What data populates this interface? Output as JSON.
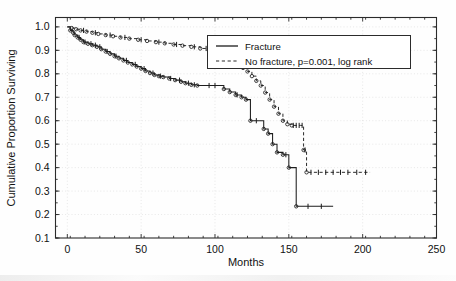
{
  "chart_data": {
    "type": "line",
    "title": "",
    "xlabel": "Months",
    "ylabel": "Cumulative Proportion Surviving",
    "xlim": [
      -8,
      250
    ],
    "ylim": [
      0.1,
      1.04
    ],
    "xticks": [
      0,
      50,
      100,
      150,
      200,
      250
    ],
    "xtick_labels": [
      "0",
      "50",
      "100",
      "150",
      "200",
      "250"
    ],
    "yticks": [
      0.1,
      0.2,
      0.3,
      0.4,
      0.5,
      0.6,
      0.7,
      0.8,
      0.9,
      1.0
    ],
    "ytick_labels": [
      "0.1",
      "0.2",
      "0.3",
      "0.4",
      "0.5",
      "0.6",
      "0.7",
      "0.8",
      "0.9",
      "1.0"
    ],
    "grid": true,
    "legend_position": "upper-right",
    "annotation": "p=0.001, log rank",
    "series": [
      {
        "name": "Fracture",
        "style": "solid",
        "points": [
          [
            0,
            1.0
          ],
          [
            2,
            0.985
          ],
          [
            4,
            0.975
          ],
          [
            5,
            0.965
          ],
          [
            7,
            0.955
          ],
          [
            9,
            0.945
          ],
          [
            11,
            0.935
          ],
          [
            14,
            0.928
          ],
          [
            17,
            0.922
          ],
          [
            20,
            0.915
          ],
          [
            23,
            0.905
          ],
          [
            26,
            0.895
          ],
          [
            29,
            0.885
          ],
          [
            32,
            0.875
          ],
          [
            35,
            0.866
          ],
          [
            38,
            0.857
          ],
          [
            41,
            0.848
          ],
          [
            44,
            0.84
          ],
          [
            47,
            0.831
          ],
          [
            50,
            0.822
          ],
          [
            53,
            0.812
          ],
          [
            56,
            0.803
          ],
          [
            59,
            0.795
          ],
          [
            62,
            0.79
          ],
          [
            65,
            0.786
          ],
          [
            69,
            0.78
          ],
          [
            73,
            0.773
          ],
          [
            77,
            0.766
          ],
          [
            80,
            0.76
          ],
          [
            84,
            0.753
          ],
          [
            88,
            0.75
          ],
          [
            104,
            0.75
          ],
          [
            106,
            0.735
          ],
          [
            110,
            0.722
          ],
          [
            114,
            0.71
          ],
          [
            118,
            0.7
          ],
          [
            121,
            0.69
          ],
          [
            124,
            0.6
          ],
          [
            131,
            0.6
          ],
          [
            133,
            0.565
          ],
          [
            136,
            0.545
          ],
          [
            139,
            0.5
          ],
          [
            142,
            0.465
          ],
          [
            146,
            0.455
          ],
          [
            150,
            0.4
          ],
          [
            152,
            0.4
          ],
          [
            155,
            0.235
          ],
          [
            180,
            0.235
          ]
        ],
        "censored_months": [
          8,
          12,
          16,
          19,
          22,
          27,
          33,
          40,
          46,
          52,
          58,
          63,
          70,
          76,
          82,
          86,
          96,
          100,
          115,
          128,
          148,
          163,
          172
        ],
        "final_survival": 0.235
      },
      {
        "name": "No fracture",
        "style": "dashed",
        "points": [
          [
            0,
            1.0
          ],
          [
            3,
            0.995
          ],
          [
            6,
            0.99
          ],
          [
            9,
            0.985
          ],
          [
            13,
            0.98
          ],
          [
            17,
            0.975
          ],
          [
            21,
            0.97
          ],
          [
            26,
            0.965
          ],
          [
            31,
            0.96
          ],
          [
            36,
            0.955
          ],
          [
            42,
            0.95
          ],
          [
            48,
            0.945
          ],
          [
            54,
            0.94
          ],
          [
            60,
            0.935
          ],
          [
            66,
            0.93
          ],
          [
            72,
            0.925
          ],
          [
            78,
            0.92
          ],
          [
            84,
            0.915
          ],
          [
            90,
            0.908
          ],
          [
            96,
            0.9
          ],
          [
            101,
            0.89
          ],
          [
            105,
            0.875
          ],
          [
            109,
            0.862
          ],
          [
            113,
            0.85
          ],
          [
            116,
            0.84
          ],
          [
            119,
            0.825
          ],
          [
            122,
            0.81
          ],
          [
            125,
            0.79
          ],
          [
            128,
            0.77
          ],
          [
            131,
            0.75
          ],
          [
            134,
            0.72
          ],
          [
            137,
            0.69
          ],
          [
            140,
            0.66
          ],
          [
            143,
            0.63
          ],
          [
            146,
            0.6
          ],
          [
            149,
            0.585
          ],
          [
            152,
            0.58
          ],
          [
            158,
            0.58
          ],
          [
            160,
            0.475
          ],
          [
            162,
            0.38
          ],
          [
            205,
            0.38
          ]
        ],
        "censored_months": [
          11,
          19,
          29,
          39,
          50,
          62,
          74,
          86,
          94,
          99,
          153,
          155,
          157,
          159,
          161,
          165,
          170,
          175,
          180,
          185,
          190,
          196,
          202
        ],
        "final_survival": 0.38
      }
    ]
  },
  "legend": {
    "entries": [
      {
        "label": "Fracture",
        "style": "solid"
      },
      {
        "label": "No fracture, p=0.001, log rank",
        "style": "dashed"
      }
    ]
  }
}
